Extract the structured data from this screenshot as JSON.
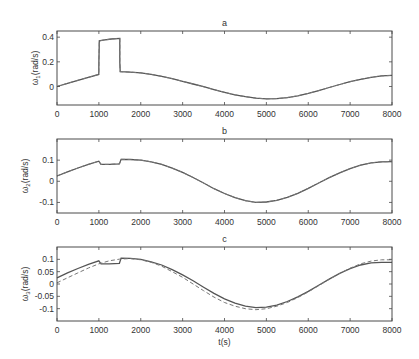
{
  "chart_data": [
    {
      "type": "line",
      "title": "a",
      "xlabel": "",
      "ylabel": "ω1(rad/s)",
      "ylabel_main": "ω",
      "ylabel_sub": "1",
      "ylabel_rest": "(rad/s)",
      "xlim": [
        0,
        8000
      ],
      "ylim": [
        -0.15,
        0.45
      ],
      "xticks": [
        0,
        1000,
        2000,
        3000,
        4000,
        5000,
        6000,
        7000,
        8000
      ],
      "yticks": [
        0,
        0.2,
        0.4
      ],
      "ytick_labels": [
        "0",
        "0.2",
        "0.4"
      ],
      "grid": false,
      "series": [
        {
          "name": "actual",
          "style": "solid",
          "x": [
            0,
            250,
            500,
            750,
            999,
            1000,
            1010,
            1100,
            1300,
            1499,
            1500,
            1510,
            1750,
            2000,
            2250,
            2500,
            2750,
            3000,
            3250,
            3500,
            3750,
            4000,
            4250,
            4500,
            4750,
            5000,
            5250,
            5500,
            5750,
            6000,
            6250,
            6500,
            6750,
            7000,
            7250,
            7500,
            7750,
            8000
          ],
          "values": [
            0.0,
            0.025,
            0.05,
            0.075,
            0.098,
            0.2,
            0.37,
            0.375,
            0.385,
            0.39,
            0.2,
            0.12,
            0.117,
            0.11,
            0.098,
            0.083,
            0.063,
            0.042,
            0.02,
            -0.002,
            -0.025,
            -0.047,
            -0.067,
            -0.083,
            -0.095,
            -0.1,
            -0.098,
            -0.09,
            -0.075,
            -0.056,
            -0.033,
            -0.008,
            0.016,
            0.039,
            0.058,
            0.075,
            0.086,
            0.09
          ]
        },
        {
          "name": "reference",
          "style": "dashed",
          "x": [
            0,
            250,
            500,
            750,
            999,
            1000,
            1010,
            1100,
            1300,
            1499,
            1500,
            1510,
            1750,
            2000,
            2250,
            2500,
            2750,
            3000,
            3250,
            3500,
            3750,
            4000,
            4250,
            4500,
            4750,
            5000,
            5250,
            5500,
            5750,
            6000,
            6250,
            6500,
            6750,
            7000,
            7250,
            7500,
            7750,
            8000
          ],
          "values": [
            0.0,
            0.025,
            0.05,
            0.075,
            0.098,
            0.2,
            0.37,
            0.375,
            0.385,
            0.39,
            0.2,
            0.12,
            0.117,
            0.11,
            0.098,
            0.083,
            0.063,
            0.042,
            0.02,
            -0.002,
            -0.025,
            -0.047,
            -0.067,
            -0.083,
            -0.095,
            -0.1,
            -0.098,
            -0.09,
            -0.075,
            -0.056,
            -0.033,
            -0.008,
            0.016,
            0.039,
            0.058,
            0.075,
            0.086,
            0.09
          ]
        }
      ]
    },
    {
      "type": "line",
      "title": "b",
      "xlabel": "",
      "ylabel": "ω2(rad/s)",
      "ylabel_main": "ω",
      "ylabel_sub": "2",
      "ylabel_rest": "(rad/s)",
      "xlim": [
        0,
        8000
      ],
      "ylim": [
        -0.15,
        0.2
      ],
      "xticks": [
        0,
        1000,
        2000,
        3000,
        4000,
        5000,
        6000,
        7000,
        8000
      ],
      "yticks": [
        -0.1,
        0,
        0.1
      ],
      "ytick_labels": [
        "-0.1",
        "0",
        "0.1"
      ],
      "grid": false,
      "series": [
        {
          "name": "actual",
          "style": "solid",
          "x": [
            0,
            250,
            500,
            750,
            999,
            1050,
            1250,
            1490,
            1530,
            1750,
            2000,
            2250,
            2500,
            2750,
            3000,
            3250,
            3500,
            3750,
            4000,
            4250,
            4500,
            4750,
            5000,
            5250,
            5500,
            5750,
            6000,
            6250,
            6500,
            6750,
            7000,
            7250,
            7500,
            7750,
            8000
          ],
          "values": [
            0.025,
            0.045,
            0.063,
            0.08,
            0.095,
            0.08,
            0.08,
            0.082,
            0.104,
            0.103,
            0.1,
            0.092,
            0.08,
            0.062,
            0.042,
            0.018,
            -0.008,
            -0.035,
            -0.058,
            -0.077,
            -0.092,
            -0.1,
            -0.098,
            -0.09,
            -0.076,
            -0.057,
            -0.033,
            -0.008,
            0.017,
            0.04,
            0.06,
            0.076,
            0.087,
            0.092,
            0.093
          ]
        },
        {
          "name": "reference",
          "style": "dashed",
          "x": [
            0,
            250,
            500,
            750,
            999,
            1050,
            1250,
            1490,
            1530,
            1750,
            2000,
            2250,
            2500,
            2750,
            3000,
            3250,
            3500,
            3750,
            4000,
            4250,
            4500,
            4750,
            5000,
            5250,
            5500,
            5750,
            6000,
            6250,
            6500,
            6750,
            7000,
            7250,
            7500,
            7750,
            8000
          ],
          "values": [
            0.025,
            0.045,
            0.063,
            0.08,
            0.095,
            0.08,
            0.08,
            0.082,
            0.104,
            0.103,
            0.1,
            0.092,
            0.08,
            0.062,
            0.042,
            0.018,
            -0.008,
            -0.035,
            -0.058,
            -0.077,
            -0.092,
            -0.1,
            -0.098,
            -0.09,
            -0.076,
            -0.057,
            -0.033,
            -0.008,
            0.017,
            0.04,
            0.06,
            0.076,
            0.087,
            0.092,
            0.093
          ]
        }
      ]
    },
    {
      "type": "line",
      "title": "c",
      "xlabel": "t(s)",
      "ylabel": "ω3(rad/s)",
      "ylabel_main": "ω",
      "ylabel_sub": "3",
      "ylabel_rest": "(rad/s)",
      "xlim": [
        0,
        8000
      ],
      "ylim": [
        -0.15,
        0.15
      ],
      "xticks": [
        0,
        1000,
        2000,
        3000,
        4000,
        5000,
        6000,
        7000,
        8000
      ],
      "yticks": [
        -0.1,
        -0.05,
        0,
        0.05,
        0.1
      ],
      "ytick_labels": [
        "-0.1",
        "-0.05",
        "0",
        "0.05",
        "0.1"
      ],
      "grid": false,
      "series": [
        {
          "name": "actual",
          "style": "solid",
          "x": [
            0,
            250,
            500,
            750,
            999,
            1050,
            1250,
            1490,
            1530,
            1750,
            2000,
            2250,
            2500,
            2750,
            3000,
            3250,
            3500,
            3750,
            4000,
            4250,
            4500,
            4750,
            5000,
            5250,
            5500,
            5750,
            6000,
            6250,
            6500,
            6750,
            7000,
            7250,
            7500,
            7750,
            8000
          ],
          "values": [
            0.025,
            0.045,
            0.063,
            0.08,
            0.094,
            0.082,
            0.082,
            0.084,
            0.105,
            0.104,
            0.1,
            0.09,
            0.077,
            0.058,
            0.037,
            0.013,
            -0.013,
            -0.038,
            -0.06,
            -0.078,
            -0.09,
            -0.096,
            -0.094,
            -0.086,
            -0.071,
            -0.052,
            -0.03,
            -0.005,
            0.02,
            0.043,
            0.062,
            0.077,
            0.086,
            0.088,
            0.088
          ]
        },
        {
          "name": "reference",
          "style": "dashed",
          "x": [
            0,
            250,
            500,
            750,
            1000,
            1250,
            1500,
            1750,
            2000,
            2250,
            2500,
            2750,
            3000,
            3250,
            3500,
            3750,
            4000,
            4250,
            4500,
            4750,
            5000,
            5250,
            5500,
            5750,
            6000,
            6250,
            6500,
            6750,
            7000,
            7250,
            7500,
            7750,
            8000
          ],
          "values": [
            0.005,
            0.025,
            0.045,
            0.065,
            0.082,
            0.094,
            0.101,
            0.103,
            0.098,
            0.088,
            0.072,
            0.05,
            0.027,
            0.0,
            -0.027,
            -0.053,
            -0.075,
            -0.09,
            -0.1,
            -0.104,
            -0.1,
            -0.09,
            -0.075,
            -0.055,
            -0.032,
            -0.007,
            0.019,
            0.043,
            0.064,
            0.082,
            0.093,
            0.098,
            0.098
          ]
        }
      ]
    }
  ],
  "layout": {
    "panels": [
      {
        "left": 57,
        "top": 31,
        "right": 392,
        "bottom": 105
      },
      {
        "left": 57,
        "top": 139,
        "right": 392,
        "bottom": 213
      },
      {
        "left": 57,
        "top": 247,
        "right": 392,
        "bottom": 321
      }
    ]
  },
  "colors": {
    "axis": "#4a4a4a",
    "solid_line": "#555555",
    "dashed_line": "#777777",
    "text": "#333333"
  }
}
